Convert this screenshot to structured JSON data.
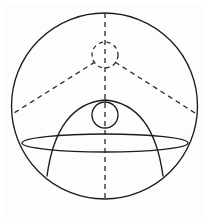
{
  "figure": {
    "background_color": "#fdfdfb",
    "stroke_color": "#1c1c1c",
    "dash_color": "#2a2a2a",
    "canvas": {
      "width": 208,
      "height": 224
    },
    "shapes": {
      "outer_circle": {
        "label": "outer-circle",
        "style": "solid",
        "cx": 104.5,
        "cy": 106,
        "r": 93
      },
      "vertical_axis": {
        "label": "vertical-axis",
        "style": "dashed",
        "x": 105,
        "y1": 13,
        "y2": 199
      },
      "top_circle": {
        "label": "top-circle",
        "style": "dashed",
        "cx": 105,
        "cy": 55,
        "r": 13
      },
      "middle_circle": {
        "label": "middle-circle",
        "style": "solid",
        "cx": 105,
        "cy": 115,
        "r": 13
      },
      "left_diagonal": {
        "label": "left-diagonal",
        "style": "dashed",
        "x1": 95,
        "y1": 62,
        "x2": 14,
        "y2": 113
      },
      "right_diagonal": {
        "label": "right-diagonal",
        "style": "dashed",
        "x1": 115,
        "y1": 62,
        "x2": 195,
        "y2": 113
      },
      "arch_curve": {
        "label": "arch-parabola",
        "style": "solid",
        "apex_x": 105,
        "apex_y": 100,
        "left_end_x": 47,
        "left_end_y": 176,
        "right_end_x": 163,
        "right_end_y": 176
      },
      "ellipse": {
        "label": "horizontal-ellipse",
        "style": "solid",
        "cx": 105,
        "cy": 143,
        "rx": 83,
        "ry": 9
      }
    }
  }
}
